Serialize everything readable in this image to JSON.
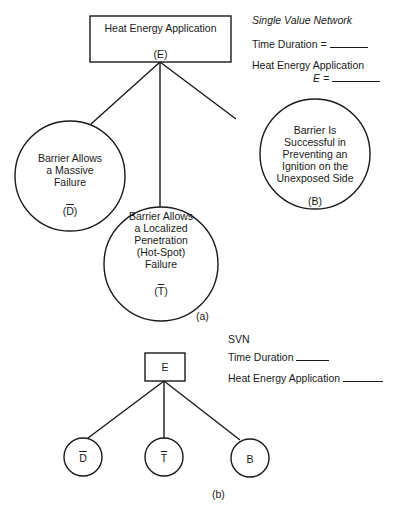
{
  "figure_a": {
    "root": {
      "label": "Heat Energy Application",
      "symbol": "(E)"
    },
    "nodes": [
      {
        "id": "D",
        "lines": [
          "Barrier Allows",
          "a Massive",
          "Failure"
        ],
        "symbol_open": "(",
        "symbol": "D",
        "symbol_close": ")",
        "overbar": true
      },
      {
        "id": "T",
        "lines": [
          "Barrier Allows",
          "a Localized",
          "Penetration",
          "(Hot-Spot)",
          "Failure"
        ],
        "symbol_open": "(",
        "symbol": "T",
        "symbol_close": ")",
        "overbar": true
      },
      {
        "id": "B",
        "lines": [
          "Barrier Is",
          "Successful in",
          "Preventing an",
          "Ignition on the",
          "Unexposed Side"
        ],
        "symbol": "(B)",
        "overbar": false
      }
    ],
    "legend": {
      "title": "Single Value Network",
      "time_duration": "Time Duration =",
      "heat_energy": "Heat Energy Application",
      "e_equals": "E ="
    },
    "caption": "(a)"
  },
  "figure_b": {
    "root": {
      "symbol": "E"
    },
    "nodes": [
      {
        "symbol": "D",
        "overbar": true
      },
      {
        "symbol": "T",
        "overbar": true
      },
      {
        "symbol": "B",
        "overbar": false
      }
    ],
    "legend": {
      "title": "SVN",
      "time_duration": "Time Duration",
      "heat_energy": "Heat Energy Application"
    },
    "caption": "(b)"
  }
}
